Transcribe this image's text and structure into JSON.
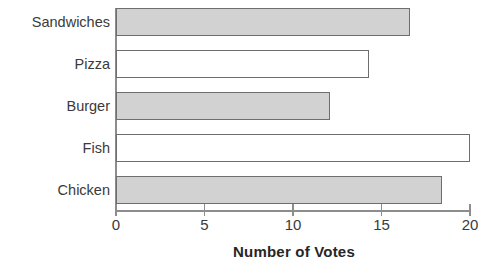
{
  "chart_data": {
    "type": "bar",
    "orientation": "horizontal",
    "title": "",
    "xlabel": "Number of Votes",
    "ylabel": "",
    "categories": [
      "Sandwiches",
      "Pizza",
      "Burger",
      "Fish",
      "Chicken"
    ],
    "values": [
      16.6,
      14.3,
      12.1,
      20.0,
      18.4
    ],
    "xlim": [
      0,
      20
    ],
    "xticks": [
      0,
      5,
      10,
      15,
      20
    ],
    "xtick_labels": [
      "0",
      "5",
      "10",
      "15",
      "20"
    ],
    "grid": false,
    "legend": null,
    "bar_styles": [
      "filled",
      "hollow",
      "filled",
      "hollow",
      "filled"
    ],
    "colors": {
      "bar_fill": "#d2d2d2",
      "bar_hollow_fill": "#ffffff",
      "bar_border": "#6e6e6e",
      "axis": "#8d8d8d",
      "text": "#3a3a3a",
      "background": "#ffffff"
    }
  }
}
